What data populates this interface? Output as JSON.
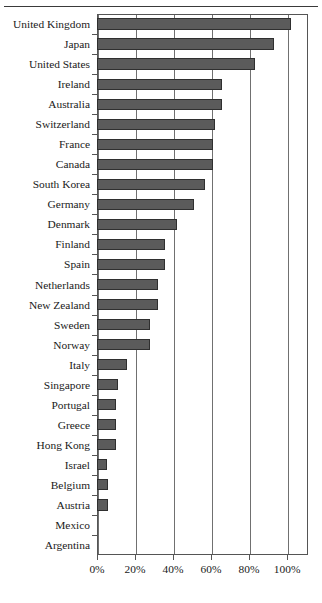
{
  "chart_data": {
    "type": "bar",
    "orientation": "horizontal",
    "title": "",
    "subtitle": "",
    "xlabel": "",
    "ylabel": "",
    "xlim": [
      0,
      111
    ],
    "grid": true,
    "legend": null,
    "value_suffix": "%",
    "xtick_labels": [
      "0%",
      "20%",
      "40%",
      "60%",
      "80%",
      "100%"
    ],
    "xtick_values": [
      0,
      20,
      40,
      60,
      80,
      100
    ],
    "categories": [
      "United Kingdom",
      "Japan",
      "United States",
      "Ireland",
      "Australia",
      "Switzerland",
      "France",
      "Canada",
      "South Korea",
      "Germany",
      "Denmark",
      "Finland",
      "Spain",
      "Netherlands",
      "New Zealand",
      "Sweden",
      "Norway",
      "Italy",
      "Singapore",
      "Portugal",
      "Greece",
      "Hong Kong",
      "Israel",
      "Belgium",
      "Austria",
      "Mexico",
      "Argentina"
    ],
    "values": [
      102,
      93,
      83,
      66,
      66,
      62,
      61,
      61,
      57,
      51,
      42,
      36,
      36,
      32,
      32,
      28,
      28,
      16,
      11,
      10,
      10,
      10,
      5,
      6,
      6,
      0,
      0
    ],
    "colors": {
      "bar_fill": "#5b5b5b",
      "bar_stroke": "#2f2f2f",
      "axis": "#555555",
      "gridline": "#707070",
      "text": "#1a1a1a",
      "background": "#ffffff"
    }
  }
}
